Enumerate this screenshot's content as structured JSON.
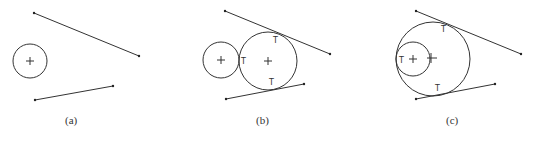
{
  "figure": {
    "panels": [
      {
        "id": "a",
        "caption": "(a)",
        "circles": [
          {
            "cx": 30,
            "cy": 61,
            "r": 17
          }
        ],
        "lines": [
          {
            "x1": 34,
            "y1": 13,
            "x2": 139,
            "y2": 56
          },
          {
            "x1": 35,
            "y1": 100,
            "x2": 113,
            "y2": 86
          }
        ],
        "tangent_labels": []
      },
      {
        "id": "b",
        "caption": "(b)",
        "circles": [
          {
            "cx": 221,
            "cy": 60,
            "r": 18
          },
          {
            "cx": 268,
            "cy": 61,
            "r": 29
          }
        ],
        "lines": [
          {
            "x1": 225,
            "y1": 11,
            "x2": 330,
            "y2": 54
          },
          {
            "x1": 226,
            "y1": 99,
            "x2": 304,
            "y2": 84
          }
        ],
        "tangent_labels": [
          {
            "text": "T",
            "x": 276,
            "y": 42
          },
          {
            "text": "T",
            "x": 243,
            "y": 64
          },
          {
            "text": "T",
            "x": 271,
            "y": 85
          }
        ]
      },
      {
        "id": "c",
        "caption": "(c)",
        "circles": [
          {
            "cx": 412,
            "cy": 60,
            "r": 37
          },
          {
            "cx": 413,
            "cy": 59,
            "r": 18
          }
        ],
        "lines": [
          {
            "x1": 416,
            "y1": 11,
            "x2": 521,
            "y2": 54
          },
          {
            "x1": 416,
            "y1": 99,
            "x2": 495,
            "y2": 84
          }
        ],
        "tangent_labels": [
          {
            "text": "T",
            "x": 443,
            "y": 33
          },
          {
            "text": "T",
            "x": 398,
            "y": 63
          },
          {
            "text": "T",
            "x": 437,
            "y": 91
          }
        ]
      }
    ]
  }
}
